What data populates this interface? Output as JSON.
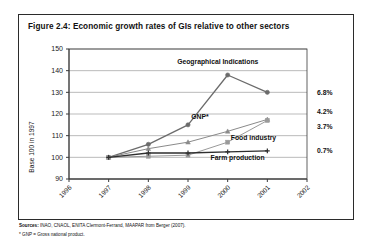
{
  "figure": {
    "title": "Figure 2.4:  Economic growth rates of GIs relative to other sectors"
  },
  "footer": {
    "sources_prefix": "Sources:",
    "sources": "INAO, CNAOL, ENITA Clermont-Ferrand, MAAPAR from Berger (2007).",
    "note": "* GNP = Gross national product."
  },
  "chart_data": {
    "type": "line",
    "title": "Economic growth rates of GIs relative to other sectors",
    "xlabel": "",
    "ylabel": "Base 100 in 1997",
    "x": [
      "1996",
      "1997",
      "1998",
      "1999",
      "2000",
      "2001",
      "2002"
    ],
    "xlim": [
      "1996",
      "2002"
    ],
    "ylim": [
      90,
      150
    ],
    "yticks": [
      90,
      100,
      110,
      120,
      130,
      140,
      150
    ],
    "grid": true,
    "legend": "inline-annotations",
    "series": [
      {
        "name": "Geographical Indications",
        "annotation": "6.8%",
        "marker": "circle",
        "color": "#6b6b6b",
        "x": [
          "1997",
          "1998",
          "1999",
          "2000",
          "2001"
        ],
        "values": [
          100,
          106,
          115,
          138,
          130
        ]
      },
      {
        "name": "GNP*",
        "annotation": "3.7%",
        "marker": "triangle",
        "color": "#8a8a8a",
        "x": [
          "1997",
          "1998",
          "1999",
          "2000",
          "2001"
        ],
        "values": [
          100,
          104,
          107,
          112,
          117.5
        ]
      },
      {
        "name": "Food industry",
        "annotation": "0.7%",
        "marker": "square",
        "color": "#9a9a9a",
        "x": [
          "1997",
          "1998",
          "1999",
          "2000",
          "2001"
        ],
        "values": [
          100,
          100.5,
          101,
          107,
          117
        ]
      },
      {
        "name": "Farm production",
        "annotation": "",
        "marker": "plus",
        "color": "#2e2e2e",
        "x": [
          "1997",
          "1998",
          "1999",
          "2000",
          "2001"
        ],
        "values": [
          100,
          102,
          102,
          102.5,
          103
        ]
      }
    ],
    "annotations_right": [
      {
        "label": "6.8%",
        "value": 130
      },
      {
        "label": "4.2%",
        "value": 121
      },
      {
        "label": "3.7%",
        "value": 114
      },
      {
        "label": "0.7%",
        "value": 103
      }
    ],
    "inline_labels": [
      {
        "text": "Geographical Indications",
        "x": "1999.75",
        "value": 143
      },
      {
        "text": "GNP*",
        "x": "1999.3",
        "value": 117.5
      },
      {
        "text": "Food industry",
        "x": "2000.65",
        "value": 108
      },
      {
        "text": "Farm production",
        "x": "2000.25",
        "value": 99
      }
    ]
  }
}
